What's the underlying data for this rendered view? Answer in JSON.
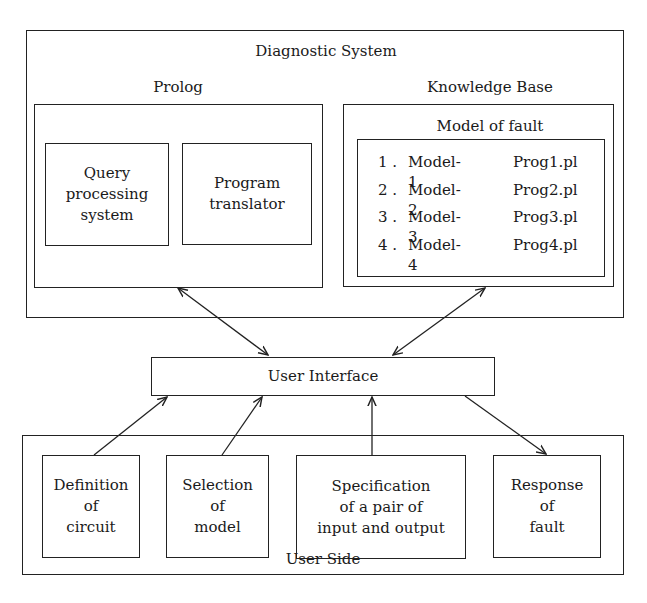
{
  "diagnostic_system": {
    "title": "Diagnostic System",
    "prolog": {
      "title": "Prolog",
      "components": [
        {
          "lines": [
            "Query",
            "processing",
            "system"
          ]
        },
        {
          "lines": [
            "Program",
            "translator"
          ]
        }
      ]
    },
    "knowledge_base": {
      "title": "Knowledge Base",
      "model_of_fault": {
        "title": "Model of fault",
        "items": [
          {
            "num": "1 .",
            "model": "Model-1",
            "prog": "Prog1.pl"
          },
          {
            "num": "2 .",
            "model": "Model-2",
            "prog": "Prog2.pl"
          },
          {
            "num": "3 .",
            "model": "Model-3",
            "prog": "Prog3.pl"
          },
          {
            "num": "4 .",
            "model": "Model-4",
            "prog": "Prog4.pl"
          }
        ]
      }
    }
  },
  "user_interface": {
    "title": "User Interface"
  },
  "user_side": {
    "title": "User Side",
    "components": [
      {
        "lines": [
          "Definition",
          "of",
          "circuit"
        ]
      },
      {
        "lines": [
          "Selection",
          "of",
          "model"
        ]
      },
      {
        "lines": [
          "Specification",
          "of a pair of",
          "input and output"
        ]
      },
      {
        "lines": [
          "Response",
          "of",
          "fault"
        ]
      }
    ]
  },
  "connections": [
    {
      "from": "prolog",
      "to": "user_interface",
      "type": "bidirectional"
    },
    {
      "from": "knowledge_base",
      "to": "user_interface",
      "type": "bidirectional"
    },
    {
      "from": "definition_of_circuit",
      "to": "user_interface",
      "type": "directed"
    },
    {
      "from": "selection_of_model",
      "to": "user_interface",
      "type": "directed"
    },
    {
      "from": "specification_of_input_output",
      "to": "user_interface",
      "type": "directed"
    },
    {
      "from": "user_interface",
      "to": "response_of_fault",
      "type": "directed"
    }
  ],
  "colors": {
    "line": "#222222",
    "background": "#ffffff",
    "text": "#1a1a1a"
  }
}
